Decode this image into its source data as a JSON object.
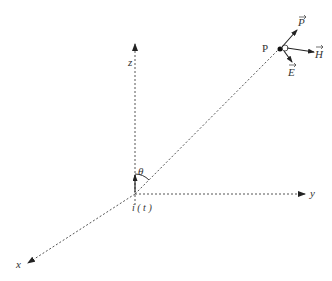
{
  "diagram": {
    "type": "3d-coordinate-system",
    "colors": {
      "line": "#333333",
      "dotted": "#555555",
      "background": "#ffffff"
    },
    "axes": {
      "z": {
        "label": "z"
      },
      "y": {
        "label": "y"
      },
      "x": {
        "label": "x"
      }
    },
    "origin": {
      "label": "i ( t )"
    },
    "angle": {
      "label": "θ"
    },
    "point": {
      "label": "P"
    },
    "vectors": {
      "poynting": {
        "label": "P",
        "has_arrow_accent": true
      },
      "magnetic": {
        "label": "H",
        "has_arrow_accent": true
      },
      "electric": {
        "label": "E",
        "has_arrow_accent": true
      }
    }
  }
}
